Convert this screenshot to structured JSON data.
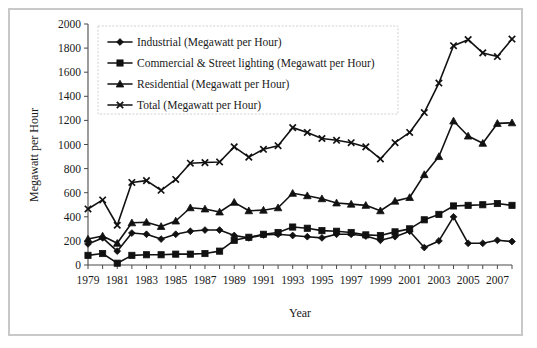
{
  "chart_data": {
    "type": "line",
    "title": "",
    "xlabel": "Year",
    "ylabel": "Megawatt per Hour",
    "grid": false,
    "legend_position": "top-left",
    "xlim": [
      1979,
      2008
    ],
    "ylim": [
      0,
      2000
    ],
    "ytick_step": 200,
    "yticks": [
      0,
      200,
      400,
      600,
      800,
      1000,
      1200,
      1400,
      1600,
      1800,
      2000
    ],
    "xticks": [
      1979,
      1981,
      1983,
      1985,
      1987,
      1989,
      1991,
      1993,
      1995,
      1997,
      1999,
      2001,
      2003,
      2005,
      2007
    ],
    "x": [
      1979,
      1980,
      1981,
      1982,
      1983,
      1984,
      1985,
      1986,
      1987,
      1988,
      1989,
      1990,
      1991,
      1992,
      1993,
      1994,
      1995,
      1996,
      1997,
      1998,
      1999,
      2000,
      2001,
      2002,
      2003,
      2004,
      2005,
      2006,
      2007,
      2008
    ],
    "series": [
      {
        "name": "Industrial (Megawatt per Hour)",
        "marker": "diamond",
        "color": "#111111",
        "values": [
          175,
          225,
          115,
          265,
          255,
          215,
          255,
          280,
          290,
          290,
          245,
          225,
          250,
          255,
          245,
          235,
          225,
          255,
          255,
          240,
          205,
          235,
          280,
          145,
          200,
          400,
          180,
          180,
          205,
          195
        ]
      },
      {
        "name": "Commercial & Street lighting (Megawatt per Hour)",
        "marker": "square",
        "color": "#111111",
        "values": [
          80,
          95,
          15,
          80,
          85,
          85,
          90,
          90,
          95,
          115,
          205,
          230,
          255,
          270,
          315,
          305,
          285,
          280,
          270,
          250,
          245,
          275,
          300,
          375,
          420,
          490,
          495,
          500,
          510,
          495
        ]
      },
      {
        "name": "Residential (Megawatt per Hour)",
        "marker": "triangle",
        "color": "#111111",
        "values": [
          215,
          240,
          180,
          350,
          355,
          320,
          365,
          475,
          465,
          440,
          520,
          450,
          455,
          475,
          595,
          575,
          550,
          515,
          505,
          495,
          450,
          530,
          560,
          750,
          900,
          1195,
          1070,
          1010,
          1175,
          1180
        ]
      },
      {
        "name": "Total (Megawatt per Hour)",
        "marker": "cross",
        "color": "#111111",
        "values": [
          465,
          540,
          330,
          685,
          700,
          620,
          710,
          845,
          850,
          855,
          980,
          895,
          960,
          990,
          1140,
          1100,
          1050,
          1035,
          1015,
          980,
          880,
          1015,
          1100,
          1265,
          1510,
          1820,
          1870,
          1760,
          1730,
          1875
        ]
      }
    ]
  }
}
